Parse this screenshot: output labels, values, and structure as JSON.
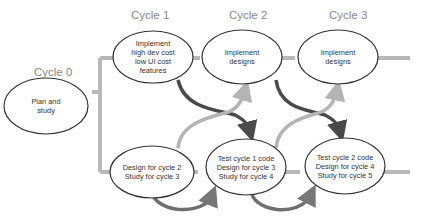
{
  "cycles": [
    {
      "label": "Cycle 0"
    },
    {
      "label": "Cycle 1"
    },
    {
      "label": "Cycle 2"
    },
    {
      "label": "Cycle 3"
    }
  ],
  "nodes": {
    "plan": {
      "lines": [
        "Plan and",
        "study"
      ]
    },
    "impl1": {
      "lines": [
        "Implement",
        "high dev cost",
        "low UI cost",
        "features"
      ]
    },
    "impl2": {
      "lines": [
        "Implement",
        "designs"
      ]
    },
    "impl3": {
      "lines": [
        "Implement",
        "designs"
      ]
    },
    "design1": {
      "lines": [
        "Design for cycle 2",
        "Study for cycle 3"
      ]
    },
    "design2": {
      "lines": [
        "Test cycle 1 code",
        "Design for cycle 3",
        "Study for cycle 4"
      ]
    },
    "design3": {
      "lines": [
        "Test cycle 2 code",
        "Design for cycle 4",
        "Study for cycle 5"
      ]
    }
  },
  "colors": {
    "track": "#b8b8b8",
    "dark_arrow": "#4a4a4a",
    "light_arrow": "#b4b4b4",
    "ellipse_stroke": "#333333",
    "label": "#8a8a8a"
  }
}
